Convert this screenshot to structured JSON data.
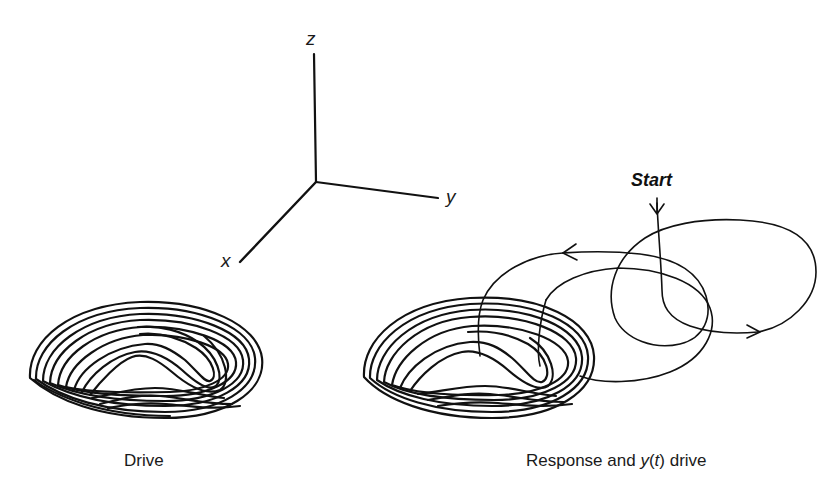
{
  "axes": {
    "x_label": "x",
    "y_label": "y",
    "z_label": "z"
  },
  "panels": {
    "drive": {
      "caption": "Drive"
    },
    "response": {
      "caption_pre": "Response and ",
      "caption_var": "y",
      "caption_open": "(",
      "caption_t": "t",
      "caption_close": ")",
      "caption_post": " drive",
      "start_label": "Start"
    }
  },
  "colors": {
    "ink": "#111111",
    "background": "#ffffff"
  }
}
